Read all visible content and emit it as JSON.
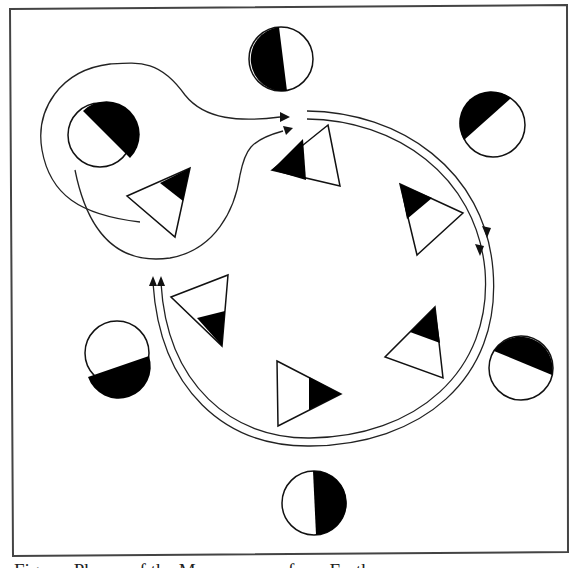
{
  "figure": {
    "type": "moon-phase-orbit-diagram",
    "frame": {
      "stroke": "#444444"
    },
    "colors": {
      "ink": "#111111",
      "fill_dark": "#000000",
      "fill_light": "#ffffff"
    },
    "caption": "Figure: Phases of the Moon as seen from Earth"
  },
  "moons_outer": [
    {
      "id": "top",
      "cx": 281,
      "cy": 59,
      "r": 32,
      "dark_side": "left",
      "phase": "first-quarter"
    },
    {
      "id": "top-right",
      "cx": 493,
      "cy": 125,
      "r": 32,
      "dark_side": "upper-left",
      "phase": "waxing"
    },
    {
      "id": "right",
      "cx": 521,
      "cy": 368,
      "r": 32,
      "dark_side": "top",
      "phase": "waxing-gibbous"
    },
    {
      "id": "bottom",
      "cx": 314,
      "cy": 503,
      "r": 32,
      "dark_side": "right",
      "phase": "last-quarter"
    },
    {
      "id": "left",
      "cx": 117,
      "cy": 353,
      "r": 32,
      "dark_side": "bottom",
      "phase": "waning"
    },
    {
      "id": "upper-left",
      "cx": 100,
      "cy": 135,
      "r": 32,
      "dark_side": "upper-right",
      "phase": "crescent"
    }
  ],
  "triangles_inner": [
    {
      "id": "t-top"
    },
    {
      "id": "t-upper-right"
    },
    {
      "id": "t-right"
    },
    {
      "id": "t-bottom"
    },
    {
      "id": "t-left"
    },
    {
      "id": "t-upper-left"
    }
  ],
  "orbit_path": {
    "style": "double-line-arc",
    "direction": "clockwise",
    "arrows": 4
  },
  "loop_path": {
    "style": "single-line-loop",
    "arrows": 2
  }
}
